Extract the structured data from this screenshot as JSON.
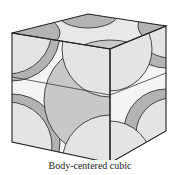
{
  "figure": {
    "caption": "Body-centered cubic",
    "colors": {
      "light_sphere": "#e4e4e4",
      "dark_sphere": "#b3b3b3",
      "mid_sphere": "#c8c8c8",
      "edge": "#222222",
      "background": "#ffffff"
    }
  }
}
